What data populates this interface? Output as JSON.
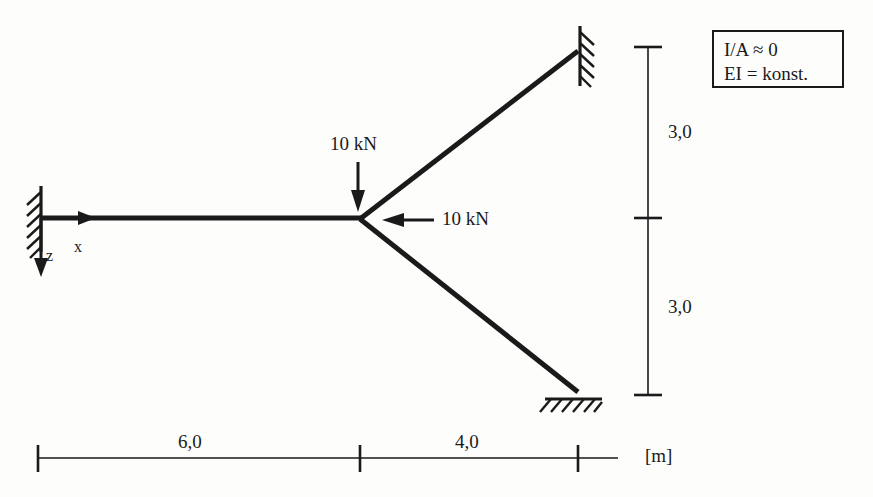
{
  "figure": {
    "kind": "structural-frame-diagram",
    "units_label": "[m]",
    "stroke_color": "#1a1a1a",
    "background_color": "#fdfdfc"
  },
  "legend": {
    "lines": [
      "I/A ≈ 0",
      "EI = konst."
    ]
  },
  "axes": {
    "x_label": "x",
    "z_label": "z"
  },
  "loads": [
    {
      "name": "vertical-point-load",
      "label": "10 kN",
      "direction": "down"
    },
    {
      "name": "horizontal-point-load",
      "label": "10 kN",
      "direction": "left"
    }
  ],
  "dimensions": {
    "horizontal": [
      {
        "label": "6,0"
      },
      {
        "label": "4,0"
      }
    ],
    "vertical": [
      {
        "label": "3,0"
      },
      {
        "label": "3,0"
      }
    ],
    "unit": "[m]"
  },
  "supports": [
    {
      "name": "left-fixed-support",
      "type": "fixed-wall"
    },
    {
      "name": "top-right-fixed-support",
      "type": "fixed-wall"
    },
    {
      "name": "bottom-right-support",
      "type": "fixed-ground"
    }
  ],
  "members": [
    {
      "name": "horizontal-beam"
    },
    {
      "name": "upper-diagonal-member"
    },
    {
      "name": "lower-diagonal-member"
    }
  ]
}
